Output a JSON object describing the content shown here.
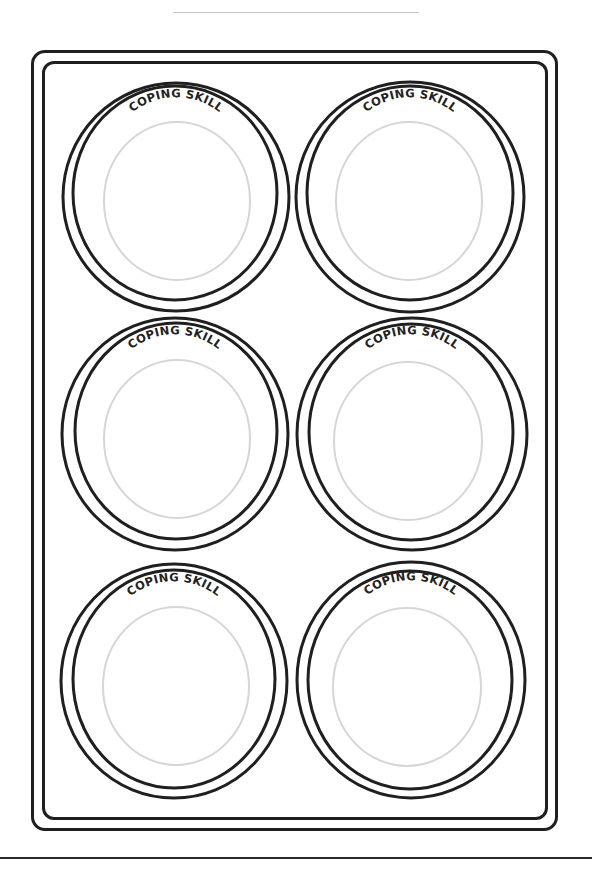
{
  "worksheet": {
    "plate_label": "COPING SKILL",
    "plates": [
      {
        "id": "plate-1",
        "position": "top-left",
        "label": "COPING SKILL",
        "cx": 176,
        "cy": 197
      },
      {
        "id": "plate-2",
        "position": "top-right",
        "label": "COPING SKILL",
        "cx": 410,
        "cy": 197
      },
      {
        "id": "plate-3",
        "position": "middle-left",
        "label": "COPING SKILL",
        "cx": 175,
        "cy": 434
      },
      {
        "id": "plate-4",
        "position": "middle-right",
        "label": "COPING SKILL",
        "cx": 412,
        "cy": 434
      },
      {
        "id": "plate-5",
        "position": "bottom-left",
        "label": "COPING SKILL",
        "cx": 174,
        "cy": 681
      },
      {
        "id": "plate-6",
        "position": "bottom-right",
        "label": "COPING SKILL",
        "cx": 411,
        "cy": 680
      }
    ],
    "colors": {
      "outline": "#1f1f1f",
      "inner_guide": "#d6d6d6",
      "background": "#ffffff"
    }
  }
}
